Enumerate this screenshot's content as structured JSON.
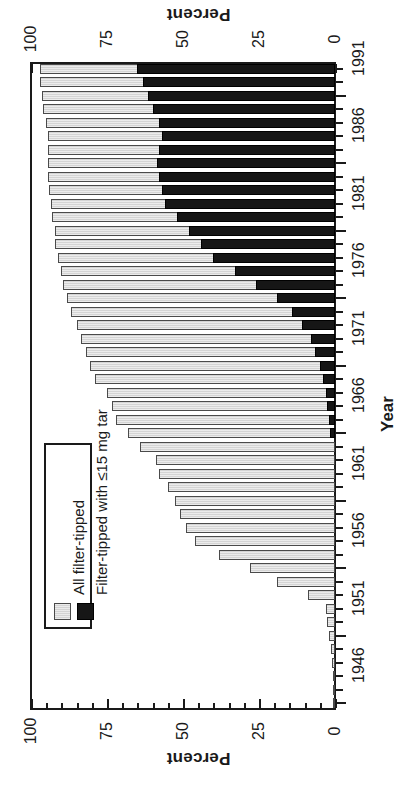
{
  "figure": {
    "value_axis_title": "Percent",
    "category_axis_title": "Year",
    "orientation": "rotated-180",
    "colors": {
      "all_filter_tipped": "#d4d4d4",
      "low_tar": "#161616",
      "axis": "#1a1a1a",
      "background": "#ffffff"
    }
  },
  "value_axis": {
    "tick_labels": [
      "100",
      "75",
      "50",
      "25",
      "0"
    ],
    "tick_values": [
      100,
      75,
      50,
      25,
      0
    ],
    "minor_step": 5,
    "range": [
      0,
      100
    ]
  },
  "category_axis": {
    "tick_labels": [
      "1991",
      "1986",
      "1981",
      "1976",
      "1971",
      "1966",
      "1961",
      "1956",
      "1951",
      "1946"
    ],
    "tick_values": [
      1991,
      1986,
      1981,
      1976,
      1971,
      1966,
      1961,
      1956,
      1951,
      1946
    ]
  },
  "legend": {
    "entries": [
      {
        "label": "All filter-tipped",
        "swatch": "light-gray-hatched"
      },
      {
        "label": "Filter-tipped with ≤15 mg tar",
        "swatch": "solid-black"
      }
    ]
  },
  "chart_data": {
    "type": "bar",
    "title": "",
    "subtitle": "",
    "xlabel": "Percent",
    "ylabel": "Year",
    "xlim": [
      0,
      100
    ],
    "grid": false,
    "legend_position": "lower-left-inside",
    "orientation": "horizontal",
    "note": "Bars run right-to-left from 0; the black low-tar series is overlaid on the light-gray all-filter-tipped series.",
    "categories": [
      1946,
      1947,
      1948,
      1949,
      1950,
      1951,
      1952,
      1953,
      1954,
      1955,
      1956,
      1957,
      1958,
      1959,
      1960,
      1961,
      1962,
      1963,
      1964,
      1965,
      1966,
      1967,
      1968,
      1969,
      1970,
      1971,
      1972,
      1973,
      1974,
      1975,
      1976,
      1977,
      1978,
      1979,
      1980,
      1981,
      1982,
      1983,
      1984,
      1985,
      1986,
      1987,
      1988,
      1989,
      1990,
      1991,
      1992,
      1993
    ],
    "series": [
      {
        "name": "All filter-tipped",
        "values": [
          0.6,
          0.6,
          0.6,
          1.0,
          1.4,
          2.0,
          2.5,
          3.0,
          9.0,
          19.0,
          28.0,
          38.0,
          46.0,
          49.0,
          51.0,
          52.5,
          55.0,
          58.0,
          59.0,
          64.0,
          68.0,
          72.0,
          73.5,
          75.0,
          79.0,
          80.5,
          82.0,
          83.5,
          85.0,
          87.0,
          88.0,
          89.5,
          90.0,
          91.0,
          92.0,
          92.0,
          93.0,
          93.5,
          94.0,
          94.5,
          94.5,
          94.5,
          94.5,
          95.0,
          96.0,
          96.5,
          97.0,
          97.0
        ]
      },
      {
        "name": "Filter-tipped with ≤15 mg tar",
        "values": [
          0,
          0,
          0,
          0,
          0,
          0,
          0,
          0,
          0,
          0,
          0,
          0,
          0,
          0,
          0,
          0,
          0,
          0,
          0,
          0,
          1.5,
          2.0,
          2.5,
          3.0,
          4.0,
          5.0,
          6.5,
          8.0,
          11.0,
          14.0,
          19.0,
          26.0,
          33.0,
          40.0,
          44.0,
          48.0,
          52.0,
          56.0,
          57.0,
          58.0,
          58.5,
          58.0,
          57.0,
          58.0,
          60.0,
          61.5,
          63.0,
          65.0
        ]
      }
    ]
  }
}
